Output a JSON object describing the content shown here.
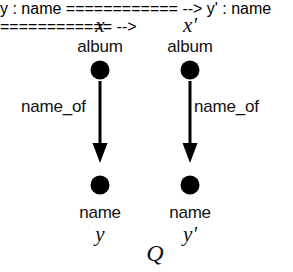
{
  "figure": {
    "caption": "Q",
    "background_color": "#ffffff",
    "ink_color": "#000000"
  },
  "graph": {
    "nodes": [
      {
        "id": "x",
        "variable": "x",
        "type_label": "album",
        "cx": 100,
        "cy": 70,
        "r": 9.5
      },
      {
        "id": "xprime",
        "variable": "x'",
        "type_label": "album",
        "cx": 190,
        "cy": 70,
        "r": 9.5
      },
      {
        "id": "y",
        "variable": "y",
        "type_label": "name",
        "cx": 100,
        "cy": 185,
        "r": 9.5
      },
      {
        "id": "yprime",
        "variable": "y'",
        "type_label": "name",
        "cx": 190,
        "cy": 185,
        "r": 9.5
      }
    ],
    "edges": [
      {
        "from": "x",
        "to": "y",
        "label": "name_of",
        "label_side": "left",
        "x": 100,
        "y1": 81,
        "y2": 163
      },
      {
        "from": "xprime",
        "to": "yprime",
        "label": "name_of",
        "label_side": "right",
        "x": 190,
        "y1": 81,
        "y2": 163
      }
    ]
  },
  "left_pattern": {
    "top_variable": "x",
    "top_type": "album",
    "edge_label": "name_of",
    "bottom_type": "name",
    "bottom_variable": "y"
  },
  "right_pattern": {
    "top_variable": "x'",
    "top_type": "album",
    "edge_label": "name_of",
    "bottom_type": "name",
    "bottom_variable": "y'"
  }
}
